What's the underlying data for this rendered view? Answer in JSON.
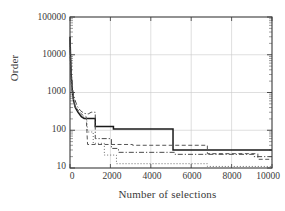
{
  "chart_data": {
    "type": "line",
    "title": "",
    "xlabel": "Number of selections",
    "ylabel": "Order",
    "xlim": [
      0,
      10000
    ],
    "ylim": [
      10,
      100000
    ],
    "yscale": "log",
    "xscale": "linear",
    "grid": true,
    "legend": "none",
    "xticks": [
      "0",
      "2000",
      "4000",
      "6000",
      "8000",
      "10000"
    ],
    "xtick_values": [
      0,
      2000,
      4000,
      6000,
      8000,
      10000
    ],
    "yticks": [
      "10",
      "100",
      "1000",
      "10000",
      "100000"
    ],
    "ytick_values": [
      10,
      100,
      1000,
      10000,
      100000
    ],
    "series": [
      {
        "name": "solid",
        "style": "solid",
        "color": "#1a1a1a",
        "width": 1.5,
        "points": [
          [
            0,
            30000
          ],
          [
            30,
            8000
          ],
          [
            60,
            3000
          ],
          [
            110,
            1200
          ],
          [
            180,
            600
          ],
          [
            260,
            400
          ],
          [
            400,
            300
          ],
          [
            560,
            230
          ],
          [
            700,
            205
          ],
          [
            1250,
            205
          ],
          [
            1250,
            125
          ],
          [
            2150,
            125
          ],
          [
            2150,
            108
          ],
          [
            5100,
            108
          ],
          [
            5100,
            30
          ],
          [
            10000,
            30
          ]
        ]
      },
      {
        "name": "dashed",
        "style": "dashed",
        "color": "#555555",
        "width": 1,
        "points": [
          [
            0,
            20000
          ],
          [
            25,
            5000
          ],
          [
            60,
            1800
          ],
          [
            120,
            900
          ],
          [
            210,
            520
          ],
          [
            330,
            380
          ],
          [
            480,
            300
          ],
          [
            640,
            250
          ],
          [
            800,
            230
          ],
          [
            870,
            42
          ],
          [
            3100,
            42
          ],
          [
            3100,
            40
          ],
          [
            6800,
            40
          ],
          [
            6800,
            24
          ],
          [
            9300,
            24
          ],
          [
            9300,
            17
          ],
          [
            10000,
            17
          ]
        ]
      },
      {
        "name": "dash-dot",
        "style": "dashdot",
        "color": "#4a4a4a",
        "width": 1,
        "points": [
          [
            0,
            26000
          ],
          [
            40,
            6000
          ],
          [
            90,
            2200
          ],
          [
            150,
            1000
          ],
          [
            240,
            650
          ],
          [
            360,
            430
          ],
          [
            520,
            330
          ],
          [
            700,
            280
          ],
          [
            900,
            270
          ],
          [
            1050,
            300
          ],
          [
            1250,
            300
          ],
          [
            1250,
            60
          ],
          [
            2050,
            60
          ],
          [
            2050,
            33
          ],
          [
            2400,
            33
          ],
          [
            2400,
            26
          ],
          [
            5200,
            26
          ],
          [
            5200,
            23
          ],
          [
            9100,
            23
          ],
          [
            9100,
            20
          ],
          [
            10000,
            20
          ]
        ]
      },
      {
        "name": "dotted",
        "style": "dotted",
        "color": "#6a6a6a",
        "width": 1,
        "points": [
          [
            0,
            15000
          ],
          [
            30,
            4000
          ],
          [
            70,
            1500
          ],
          [
            130,
            800
          ],
          [
            220,
            470
          ],
          [
            350,
            340
          ],
          [
            500,
            270
          ],
          [
            680,
            225
          ],
          [
            820,
            210
          ],
          [
            880,
            90
          ],
          [
            1150,
            90
          ],
          [
            1150,
            45
          ],
          [
            1700,
            45
          ],
          [
            1700,
            22
          ],
          [
            2300,
            22
          ],
          [
            2300,
            13
          ],
          [
            6800,
            13
          ],
          [
            6800,
            11
          ],
          [
            10000,
            11
          ]
        ]
      }
    ],
    "annotations": []
  },
  "axes": {
    "frame_color": "#3a3a3a",
    "grid_color": "#c9c9c9"
  }
}
